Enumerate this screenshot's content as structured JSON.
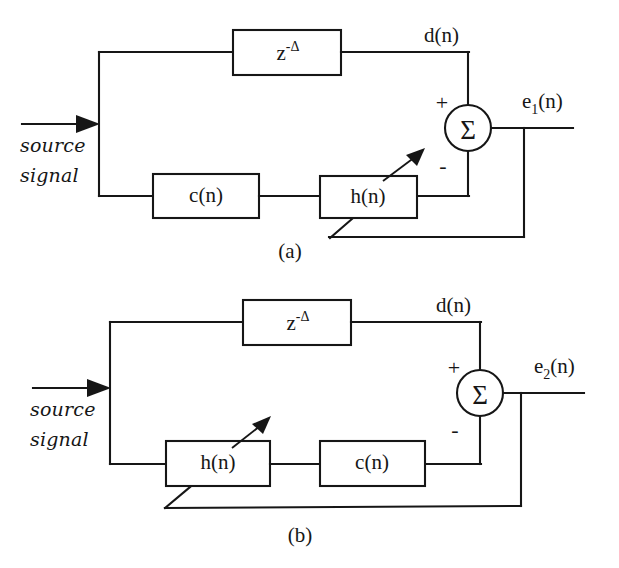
{
  "figure": {
    "background_color": "#ffffff",
    "ink_color": "#161616",
    "panels": [
      {
        "id": "panel-a",
        "caption": "(a)",
        "input_label_line1": "source",
        "input_label_line2": "signal",
        "delay_block_base": "z",
        "delay_block_exponent": "-Δ",
        "top_signal_label": "d(n)",
        "output_label_base": "e",
        "output_label_subscript": "1",
        "output_label_suffix": "(n)",
        "summer_symbol": "Σ",
        "summer_plus": "+",
        "summer_minus": "-",
        "lower_block_first": "c(n)",
        "lower_block_second": "h(n)",
        "adaptive_block": "h(n)"
      },
      {
        "id": "panel-b",
        "caption": "(b)",
        "input_label_line1": "source",
        "input_label_line2": "signal",
        "delay_block_base": "z",
        "delay_block_exponent": "-Δ",
        "top_signal_label": "d(n)",
        "output_label_base": "e",
        "output_label_subscript": "2",
        "output_label_suffix": "(n)",
        "summer_symbol": "Σ",
        "summer_plus": "+",
        "summer_minus": "-",
        "lower_block_first": "h(n)",
        "lower_block_second": "c(n)",
        "adaptive_block": "h(n)"
      }
    ]
  }
}
